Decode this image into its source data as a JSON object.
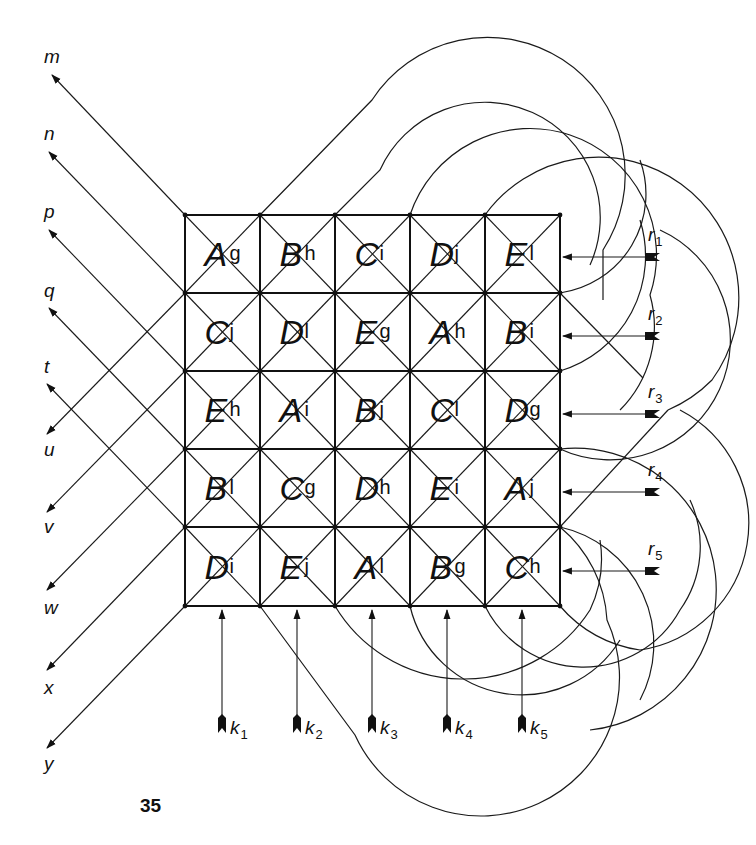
{
  "diagram": {
    "page_number": "35",
    "grid": {
      "rows": 5,
      "cols": 5,
      "cells": [
        [
          {
            "big": "A",
            "small": "g"
          },
          {
            "big": "B",
            "small": "h"
          },
          {
            "big": "C",
            "small": "i"
          },
          {
            "big": "D",
            "small": "j"
          },
          {
            "big": "E",
            "small": "l"
          }
        ],
        [
          {
            "big": "C",
            "small": "j"
          },
          {
            "big": "D",
            "small": "l"
          },
          {
            "big": "E",
            "small": "g"
          },
          {
            "big": "A",
            "small": "h"
          },
          {
            "big": "B",
            "small": "i"
          }
        ],
        [
          {
            "big": "E",
            "small": "h"
          },
          {
            "big": "A",
            "small": "i"
          },
          {
            "big": "B",
            "small": "j"
          },
          {
            "big": "C",
            "small": "l"
          },
          {
            "big": "D",
            "small": "g"
          }
        ],
        [
          {
            "big": "B",
            "small": "l"
          },
          {
            "big": "C",
            "small": "g"
          },
          {
            "big": "D",
            "small": "h"
          },
          {
            "big": "E",
            "small": "i"
          },
          {
            "big": "A",
            "small": "j"
          }
        ],
        [
          {
            "big": "D",
            "small": "i"
          },
          {
            "big": "E",
            "small": "j"
          },
          {
            "big": "A",
            "small": "l"
          },
          {
            "big": "B",
            "small": "g"
          },
          {
            "big": "C",
            "small": "h"
          }
        ]
      ]
    },
    "left_outputs_up": [
      "m",
      "n",
      "p",
      "q",
      "t"
    ],
    "left_outputs_down": [
      "u",
      "v",
      "w",
      "x",
      "y"
    ],
    "right_inputs": [
      {
        "base": "r",
        "sub": "1"
      },
      {
        "base": "r",
        "sub": "2"
      },
      {
        "base": "r",
        "sub": "3"
      },
      {
        "base": "r",
        "sub": "4"
      },
      {
        "base": "r",
        "sub": "5"
      }
    ],
    "bottom_inputs": [
      {
        "base": "k",
        "sub": "1"
      },
      {
        "base": "k",
        "sub": "2"
      },
      {
        "base": "k",
        "sub": "3"
      },
      {
        "base": "k",
        "sub": "4"
      },
      {
        "base": "k",
        "sub": "5"
      }
    ],
    "colors": {
      "ink": "#111111",
      "background": "#ffffff"
    }
  }
}
